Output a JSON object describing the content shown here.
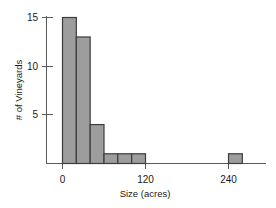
{
  "chart_data": {
    "type": "bar",
    "title": "",
    "subtitle": "",
    "xlabel": "Size (acres)",
    "ylabel": "# of Vineyards",
    "grid": false,
    "legend": null,
    "bar_style": "histogram",
    "bin_width": 20,
    "xlim": [
      -10,
      310
    ],
    "ylim": [
      0,
      15.8
    ],
    "x_ticks": [
      0,
      120,
      240
    ],
    "x_tick_labels": [
      "0",
      "120",
      "240"
    ],
    "y_ticks": [
      5,
      10,
      15
    ],
    "y_tick_labels": [
      "5",
      "10",
      "15"
    ],
    "bin_starts": [
      0,
      20,
      40,
      60,
      80,
      100,
      240
    ],
    "bin_ends": [
      20,
      40,
      60,
      80,
      100,
      120,
      260
    ],
    "categories": [
      "0-20",
      "20-40",
      "40-60",
      "60-80",
      "80-100",
      "100-120",
      "240-260"
    ],
    "values": [
      15,
      13,
      4,
      1,
      1,
      1,
      1
    ],
    "colors": {
      "bar_fill": "#9d9d9d",
      "bar_stroke": "#3d3d3d",
      "axis": "#5a5a5a",
      "text": "#1a1a1a",
      "background": "#ffffff"
    }
  },
  "labels": {
    "y_axis_title": "# of Vineyards",
    "x_axis_title": "Size (acres)",
    "y_tick_15": "15",
    "y_tick_10": "10",
    "y_tick_5": "5",
    "x_tick_0": "0",
    "x_tick_120": "120",
    "x_tick_240": "240"
  }
}
